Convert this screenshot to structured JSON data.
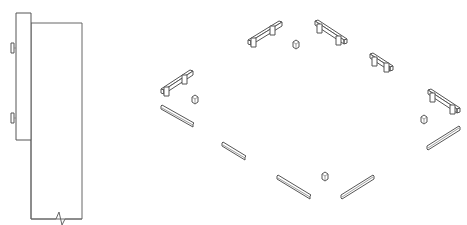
{
  "diagram": {
    "type": "isometric-technical-drawing",
    "colors": {
      "background": "#ffffff",
      "line": "#555555"
    },
    "side_elevation": {
      "frame_rect": {
        "x": 31,
        "y": 23,
        "w": 51,
        "h": 196
      },
      "door_panel": {
        "x": 16,
        "y": 13,
        "w": 15,
        "h": 127
      },
      "hinges": [
        {
          "x": 11,
          "y": 45
        },
        {
          "x": 11,
          "y": 115
        }
      ],
      "break_mark": {
        "x": 60,
        "y": 219
      }
    },
    "plan_components": {
      "benches": [
        {
          "name": "bench-top-left",
          "x1": 248,
          "y1": 43,
          "x2": 280,
          "y2": 24
        },
        {
          "name": "bench-top-right",
          "x1": 315,
          "y1": 24,
          "x2": 346,
          "y2": 43
        },
        {
          "name": "bench-right-upper",
          "x1": 370,
          "y1": 57,
          "x2": 392,
          "y2": 71
        },
        {
          "name": "bench-right-lower",
          "x1": 428,
          "y1": 93,
          "x2": 459,
          "y2": 112
        },
        {
          "name": "bench-left",
          "x1": 161,
          "y1": 92,
          "x2": 191,
          "y2": 73
        }
      ],
      "posts": [
        {
          "name": "post-top",
          "x": 296,
          "y": 44
        },
        {
          "name": "post-left",
          "x": 195,
          "y": 99
        },
        {
          "name": "post-right",
          "x": 424,
          "y": 119
        },
        {
          "name": "post-bottom",
          "x": 325,
          "y": 176
        }
      ],
      "planks": [
        {
          "name": "plank-left",
          "x1": 161,
          "y1": 108,
          "x2": 194,
          "y2": 126
        },
        {
          "name": "plank-center-left",
          "x1": 222,
          "y1": 144,
          "x2": 245,
          "y2": 158
        },
        {
          "name": "plank-bottom-left",
          "x1": 277,
          "y1": 177,
          "x2": 310,
          "y2": 197
        },
        {
          "name": "plank-bottom-right",
          "x1": 341,
          "y1": 197,
          "x2": 373,
          "y2": 177
        },
        {
          "name": "plank-right",
          "x1": 427,
          "y1": 148,
          "x2": 459,
          "y2": 128
        }
      ]
    }
  }
}
